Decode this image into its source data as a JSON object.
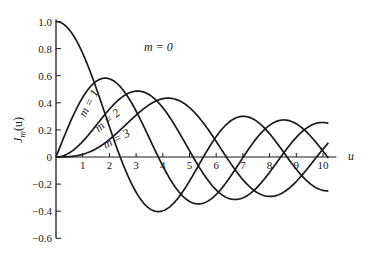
{
  "chart_data": {
    "type": "line",
    "title": "",
    "xlabel": "u",
    "ylabel": "J_m(u)",
    "ylabel_display": {
      "main": "J",
      "sub": "m",
      "arg": "(u)"
    },
    "xlim": [
      0,
      10.5
    ],
    "ylim": [
      -0.6,
      1.0
    ],
    "grid": false,
    "legend": "none (inline curve labels)",
    "x_ticks": [
      "1",
      "2",
      "3",
      "4",
      "5",
      "6",
      "7",
      "8",
      "9",
      "10"
    ],
    "y_ticks": [
      {
        "value": 1.0,
        "label": "1.0"
      },
      {
        "value": 0.8,
        "label": "0.8"
      },
      {
        "value": 0.6,
        "label": "0.6"
      },
      {
        "value": 0.4,
        "label": "0.4"
      },
      {
        "value": 0.2,
        "label": "0.2"
      },
      {
        "value": 0,
        "label": "0"
      },
      {
        "value": -0.2,
        "label": "−0.2"
      },
      {
        "value": -0.4,
        "label": "−0.4"
      },
      {
        "value": -0.6,
        "label": "−0.6"
      }
    ],
    "series": [
      {
        "name": "m = 0",
        "order": 0,
        "x": [
          0,
          1,
          2,
          3,
          4,
          5,
          6,
          7,
          8,
          9,
          10
        ],
        "values": [
          1.0,
          0.77,
          0.22,
          -0.26,
          -0.4,
          -0.18,
          0.15,
          0.3,
          0.17,
          -0.09,
          -0.25
        ]
      },
      {
        "name": "m = 1",
        "order": 1,
        "x": [
          0,
          1,
          2,
          3,
          4,
          5,
          6,
          7,
          8,
          9,
          10
        ],
        "values": [
          0,
          0.44,
          0.58,
          0.34,
          -0.07,
          -0.33,
          -0.28,
          0.0,
          0.23,
          0.25,
          0.04
        ]
      },
      {
        "name": "m = 2",
        "order": 2,
        "x": [
          0,
          1,
          2,
          3,
          4,
          5,
          6,
          7,
          8,
          9,
          10
        ],
        "values": [
          0,
          0.11,
          0.35,
          0.49,
          0.36,
          0.05,
          -0.24,
          -0.3,
          -0.11,
          0.14,
          0.25
        ]
      },
      {
        "name": "m = 3",
        "order": 3,
        "x": [
          0,
          1,
          2,
          3,
          4,
          5,
          6,
          7,
          8,
          9,
          10
        ],
        "values": [
          0,
          0.02,
          0.13,
          0.31,
          0.43,
          0.36,
          0.11,
          -0.17,
          -0.29,
          -0.18,
          0.06
        ]
      }
    ],
    "annotations": [
      {
        "text": "m = 0",
        "x": 3.3,
        "y": 0.78,
        "rotation": 0
      },
      {
        "text": "m = 1",
        "x": 1.1,
        "y": 0.29,
        "rotation": -62
      },
      {
        "text": "m = 2",
        "x": 1.6,
        "y": 0.18,
        "rotation": -40
      },
      {
        "text": "m = 3",
        "x": 1.85,
        "y": 0.06,
        "rotation": -28
      }
    ]
  },
  "colors": {
    "line": "#1a1a1a",
    "background": "#ffffff"
  }
}
